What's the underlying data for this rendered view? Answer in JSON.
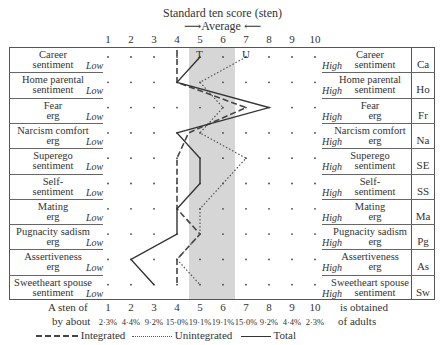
{
  "chart_data": {
    "type": "line",
    "title": "Standard ten score (sten)",
    "subtitle": "Average",
    "xlabel": "Standard ten score (sten)",
    "ylabel": "",
    "x_ticks": [
      1,
      2,
      3,
      4,
      5,
      6,
      7,
      8,
      9,
      10
    ],
    "xlim": [
      1,
      10
    ],
    "average_band": [
      4.5,
      6.5
    ],
    "categories": [
      {
        "code": "Ca",
        "label": "Career sentiment"
      },
      {
        "code": "Ho",
        "label": "Home parental sentiment"
      },
      {
        "code": "Fr",
        "label": "Fear erg"
      },
      {
        "code": "Na",
        "label": "Narcism comfort erg"
      },
      {
        "code": "SE",
        "label": "Superego sentiment"
      },
      {
        "code": "SS",
        "label": "Self-sentiment"
      },
      {
        "code": "Ma",
        "label": "Mating erg"
      },
      {
        "code": "Pg",
        "label": "Pugnacity sadism erg"
      },
      {
        "code": "As",
        "label": "Assertiveness erg"
      },
      {
        "code": "Sw",
        "label": "Sweetheart spouse sentiment"
      }
    ],
    "series": [
      {
        "name": "Integrated",
        "style": "dashed",
        "values": [
          4,
          4,
          7,
          4.5,
          4,
          4,
          4,
          5,
          4,
          4
        ]
      },
      {
        "name": "Unintegrated",
        "style": "dotted",
        "values": [
          7,
          5,
          6,
          5,
          7,
          6,
          5,
          5,
          4,
          5
        ]
      },
      {
        "name": "Total",
        "style": "solid",
        "values": [
          5,
          4,
          8,
          4,
          5,
          5,
          4,
          4,
          2,
          3
        ]
      }
    ],
    "series_markers": {
      "T": 5,
      "U": 7
    },
    "sten_percentages": [
      "2·3%",
      "4·4%",
      "9·2%",
      "15·0%",
      "19·1%",
      "19·1%",
      "15·0%",
      "9·2%",
      "4·4%",
      "2·3%"
    ],
    "legend_position": "bottom",
    "grid": "dots"
  },
  "header": {
    "title": "Standard ten score (sten)",
    "average": "Average",
    "ticks": [
      "1",
      "2",
      "3",
      "4",
      "5",
      "6",
      "7",
      "8",
      "9",
      "10"
    ]
  },
  "rows": [
    {
      "left": [
        "Career",
        "sentiment"
      ],
      "right": [
        "Career",
        "sentiment"
      ],
      "code": "Ca"
    },
    {
      "left": [
        "Home parental",
        "sentiment"
      ],
      "right": [
        "Home parental",
        "sentiment"
      ],
      "code": "Ho"
    },
    {
      "left": [
        "Fear",
        "erg"
      ],
      "right": [
        "Fear",
        "erg"
      ],
      "code": "Fr"
    },
    {
      "left": [
        "Narcism comfort",
        "erg"
      ],
      "right": [
        "Narcism comfort",
        "erg"
      ],
      "code": "Na"
    },
    {
      "left": [
        "Superego",
        "sentiment"
      ],
      "right": [
        "Superego",
        "sentiment"
      ],
      "code": "SE"
    },
    {
      "left": [
        "Self-",
        "sentiment"
      ],
      "right": [
        "Self-",
        "sentiment"
      ],
      "code": "SS"
    },
    {
      "left": [
        "Mating",
        "erg"
      ],
      "right": [
        "Mating",
        "erg"
      ],
      "code": "Ma"
    },
    {
      "left": [
        "Pugnacity sadism",
        "erg"
      ],
      "right": [
        "Pugnacity sadism",
        "erg"
      ],
      "code": "Pg"
    },
    {
      "left": [
        "Assertiveness",
        "erg"
      ],
      "right": [
        "Assertiveness",
        "erg"
      ],
      "code": "As"
    },
    {
      "left": [
        "Sweetheart spouse",
        "sentiment"
      ],
      "right": [
        "Sweetheart spouse",
        "sentiment"
      ],
      "code": "Sw"
    }
  ],
  "low_label": "Low",
  "high_label": "High",
  "markers": {
    "T": "T",
    "U": "U"
  },
  "footer": {
    "line1_prefix": "A sten of",
    "line1_suffix": "is obtained",
    "line2_prefix": "by about",
    "line2_suffix": "of adults",
    "percentages": [
      "2·3%",
      "4·4%",
      "9·2%",
      "15·0%",
      "19·1%",
      "19·1%",
      "15·0%",
      "9·2%",
      "4·4%",
      "2·3%"
    ],
    "legend": {
      "integrated": "Integrated",
      "unintegrated": "Unintegrated",
      "total": "Total"
    }
  }
}
